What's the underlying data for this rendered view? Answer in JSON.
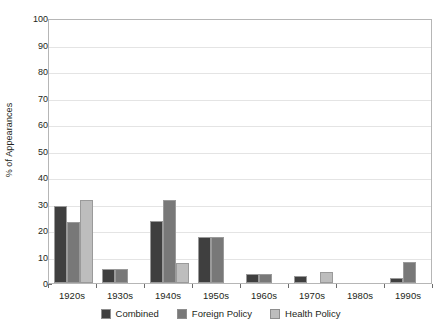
{
  "chart_data": {
    "type": "bar",
    "title": "",
    "xlabel": "",
    "ylabel": "% of Appearances",
    "categories": [
      "1920s",
      "1930s",
      "1940s",
      "1950s",
      "1960s",
      "1970s",
      "1980s",
      "1990s"
    ],
    "series": [
      {
        "name": "Combined",
        "color": "#3f3f3f",
        "values": [
          29.2,
          5.3,
          23.5,
          17.5,
          3.5,
          2.8,
          0,
          1.8
        ]
      },
      {
        "name": "Foreign Policy",
        "color": "#787878",
        "values": [
          23.0,
          5.3,
          31.5,
          17.5,
          3.5,
          0,
          0,
          8.0
        ]
      },
      {
        "name": "Health Policy",
        "color": "#bdbdbd",
        "values": [
          31.2,
          0,
          7.5,
          0,
          0,
          4.0,
          0,
          0
        ]
      }
    ],
    "ylim": [
      0,
      100
    ],
    "yticks": [
      0,
      10,
      20,
      30,
      40,
      50,
      60,
      70,
      80,
      90,
      100
    ],
    "ytick_labels": [
      "0",
      "10",
      "20",
      "30",
      "40",
      "50",
      "60",
      "70",
      "80",
      "90",
      "100"
    ],
    "grid": true,
    "grid_color": "#e4e4e4",
    "legend_position": "bottom",
    "plot_border_color": "#b6b6b6",
    "axis_text_color": "#231f20",
    "background": "#ffffff"
  }
}
